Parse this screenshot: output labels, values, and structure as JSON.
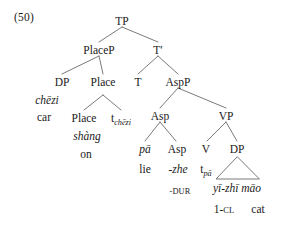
{
  "figure": {
    "example_number": "(50)",
    "type": "syntax-tree",
    "line_color": "#6b6b6b",
    "text_color": "#1a1a1a",
    "background": "#ffffff"
  },
  "nodes": {
    "tp": "TP",
    "placep": "PlaceP",
    "tbar": "T′",
    "dp_subject": "DP",
    "place_head_upper": "Place",
    "t": "T",
    "aspp": "AspP",
    "place_head_lower": "Place",
    "asp_upper": "Asp",
    "vp": "VP",
    "asp_lower": "Asp",
    "v": "V",
    "dp_object": "DP"
  },
  "terminals": {
    "chezi": "chēzi",
    "chezi_gloss": "car",
    "shang": "shàng",
    "shang_gloss": "on",
    "trace_chezi_t": "t",
    "trace_chezi_sub": "chēzi",
    "pa": "pā",
    "pa_gloss": "lie",
    "zhe": "-zhe",
    "zhe_gloss": "-DUR",
    "trace_pa_t": "t",
    "trace_pa_sub": "pā",
    "yizhimao": "yī-zhī māo",
    "yizhimao_gloss_num": "1-",
    "yizhimao_gloss_cl": "CL",
    "mao_gloss": "cat"
  }
}
